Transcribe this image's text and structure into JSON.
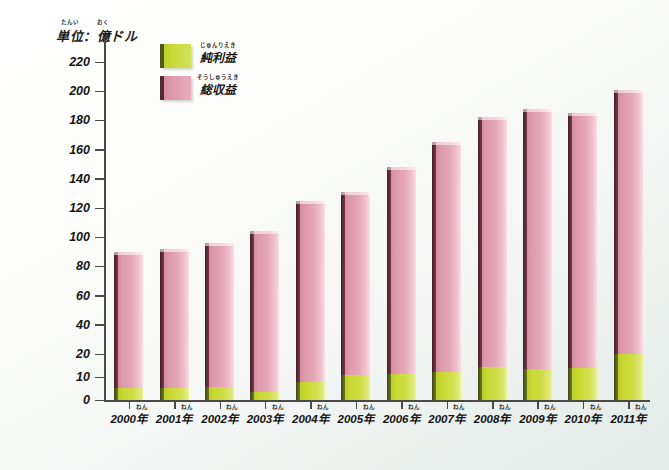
{
  "unit_caption": {
    "prefix": "単位",
    "prefix_ruby": "たんい",
    "separator": "：",
    "value": "億",
    "value_ruby": "おく",
    "suffix": "ドル",
    "full": "単位：億ドル"
  },
  "legend": {
    "items": [
      {
        "label": "純利益",
        "ruby": "じゅんりえき",
        "color": "#cada3c",
        "key": "net_profit"
      },
      {
        "label": "総収益",
        "ruby": "そうしゅうえき",
        "color": "#e09cae",
        "key": "total_revenue"
      }
    ]
  },
  "axis": {
    "y_unit_suffix": "",
    "y_ticks": [
      0,
      10,
      20,
      40,
      60,
      80,
      100,
      120,
      140,
      160,
      180,
      200,
      220
    ],
    "x_label_suffix": "年",
    "x_label_ruby": "ねん"
  },
  "chart_data": {
    "type": "bar",
    "title": "",
    "subtitle": "",
    "xlabel": "",
    "ylabel": "単位：億ドル",
    "categories": [
      "2000年",
      "2001年",
      "2002年",
      "2003年",
      "2004年",
      "2005年",
      "2006年",
      "2007年",
      "2008年",
      "2009年",
      "2010年",
      "2011年"
    ],
    "category_years": [
      2000,
      2001,
      2002,
      2003,
      2004,
      2005,
      2006,
      2007,
      2008,
      2009,
      2010,
      2011
    ],
    "series": [
      {
        "name": "総収益",
        "color": "#e09cae",
        "values": [
          90,
          92,
          96,
          104,
          125,
          131,
          148,
          165,
          182,
          188,
          185,
          201
        ]
      },
      {
        "name": "純利益",
        "color": "#cada3c",
        "values": [
          5,
          5,
          5.5,
          3.5,
          8,
          11,
          11.5,
          12,
          14.5,
          13.5,
          14,
          20
        ]
      }
    ],
    "stacked": true,
    "ylim": [
      0,
      228
    ],
    "y_axis_broken": true,
    "y_tick_labels": [
      "0",
      "10",
      "20",
      "40",
      "60",
      "80",
      "100",
      "120",
      "140",
      "160",
      "180",
      "200",
      "220"
    ],
    "grid": false,
    "legend_position": "top-left"
  }
}
